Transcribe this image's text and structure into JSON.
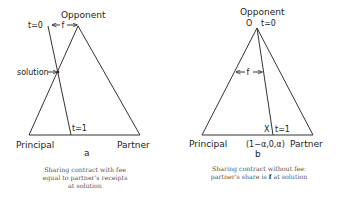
{
  "panel_a": {
    "apex_label": "Opponent",
    "t0_label": "t=0",
    "t1_label": "t=1",
    "f_label": "f",
    "solution_label": "solution",
    "left_label": "Principal",
    "right_label": "Partner",
    "panel_letter": "a",
    "caption_lines": [
      "Sharing contract with fee",
      "equal to partner's receipts",
      "at solution"
    ]
  },
  "panel_b": {
    "apex_label": "Opponent",
    "apex_point_label": "O",
    "t0_label": "t=0",
    "t1_label": "t=1",
    "f_label": "f",
    "x_label": "X",
    "base_point_label": "(1−α,0,α)",
    "left_label": "Principal",
    "right_label": "Partner",
    "panel_letter": "b",
    "caption_line1": "Sharing contract without fee:",
    "caption_line2_pre": "partner's share is ",
    "caption_line2_bold": "f",
    "caption_line2_post": " at solution"
  },
  "colors": {
    "line": "#333333",
    "text": "#222222",
    "caption": "#555555"
  }
}
